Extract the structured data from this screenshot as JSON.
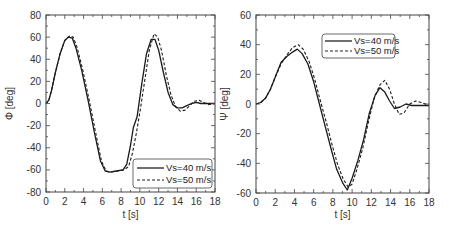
{
  "chart_data": [
    {
      "type": "line",
      "title": "",
      "xlabel": "t [s]",
      "ylabel": "Φ [deg]",
      "xlim": [
        0,
        18
      ],
      "ylim": [
        -80,
        80
      ],
      "xticks": [
        0,
        2,
        4,
        6,
        8,
        10,
        12,
        14,
        16,
        18
      ],
      "yticks": [
        -80,
        -60,
        -40,
        -20,
        0,
        20,
        40,
        60,
        80
      ],
      "grid": false,
      "legend_position": "lower right",
      "series": [
        {
          "name": "Vs=40 m/s",
          "style": "solid",
          "x": [
            0,
            0.3,
            0.6,
            1.0,
            1.5,
            2.0,
            2.4,
            2.8,
            3.2,
            3.8,
            4.5,
            5.2,
            5.8,
            6.3,
            6.8,
            7.5,
            8.2,
            8.6,
            9.0,
            9.3,
            9.7,
            10.2,
            10.7,
            11.2,
            11.6,
            12.0,
            12.5,
            13.0,
            13.5,
            14.0,
            14.5,
            15.0,
            15.5,
            16.0,
            16.5,
            17.0,
            17.5,
            18.0
          ],
          "values": [
            0,
            3,
            12,
            28,
            45,
            57,
            60,
            59,
            50,
            30,
            2,
            -28,
            -52,
            -61,
            -62,
            -61,
            -60,
            -55,
            -38,
            -22,
            -12,
            18,
            45,
            58,
            58,
            48,
            28,
            10,
            -1,
            -4,
            -4,
            -2,
            0,
            1,
            0,
            0,
            0,
            0
          ]
        },
        {
          "name": "Vs=50 m/s",
          "style": "dashed",
          "x": [
            0,
            0.3,
            0.6,
            1.0,
            1.5,
            2.0,
            2.5,
            2.9,
            3.3,
            3.9,
            4.6,
            5.3,
            5.9,
            6.4,
            6.9,
            7.6,
            8.3,
            8.8,
            9.2,
            9.6,
            10.0,
            10.5,
            11.0,
            11.5,
            11.9,
            12.3,
            12.8,
            13.3,
            13.8,
            14.3,
            14.8,
            15.3,
            15.8,
            16.3,
            16.8,
            17.3,
            18.0
          ],
          "values": [
            0,
            3,
            12,
            28,
            45,
            57,
            61,
            60,
            51,
            31,
            3,
            -27,
            -52,
            -61,
            -62,
            -61,
            -60,
            -57,
            -45,
            -28,
            -8,
            20,
            48,
            63,
            60,
            48,
            26,
            8,
            -3,
            -7,
            -6,
            -2,
            2,
            3,
            1,
            -1,
            0
          ]
        }
      ]
    },
    {
      "type": "line",
      "title": "",
      "xlabel": "t [s]",
      "ylabel": "Ψ [deg]",
      "xlim": [
        0,
        18
      ],
      "ylim": [
        -60,
        60
      ],
      "xticks": [
        0,
        2,
        4,
        6,
        8,
        10,
        12,
        14,
        16,
        18
      ],
      "yticks": [
        -60,
        -40,
        -20,
        0,
        20,
        40,
        60
      ],
      "grid": false,
      "legend_position": "upper right",
      "series": [
        {
          "name": "Vs=40 m/s",
          "style": "solid",
          "x": [
            0,
            0.5,
            1.0,
            1.5,
            2.0,
            2.6,
            3.2,
            3.8,
            4.3,
            4.8,
            5.4,
            6.0,
            6.6,
            7.2,
            7.8,
            8.4,
            9.0,
            9.5,
            10.0,
            10.6,
            11.2,
            11.8,
            12.4,
            12.9,
            13.4,
            13.9,
            14.4,
            15.0,
            15.6,
            16.2,
            16.8,
            17.4,
            18.0
          ],
          "values": [
            0,
            1,
            4,
            10,
            18,
            28,
            32,
            35,
            37,
            34,
            27,
            15,
            0,
            -15,
            -30,
            -44,
            -53,
            -58,
            -50,
            -38,
            -24,
            -6,
            6,
            11,
            8,
            2,
            -3,
            -2,
            0,
            -1,
            -1,
            -1,
            -1
          ]
        },
        {
          "name": "Vs=50 m/s",
          "style": "dashed",
          "x": [
            0,
            0.5,
            1.0,
            1.5,
            2.0,
            2.6,
            3.2,
            3.8,
            4.4,
            4.9,
            5.5,
            6.1,
            6.7,
            7.3,
            7.9,
            8.5,
            9.1,
            9.6,
            10.0,
            10.5,
            11.1,
            11.7,
            12.3,
            12.9,
            13.4,
            13.9,
            14.4,
            14.9,
            15.4,
            16.0,
            16.6,
            17.2,
            18.0
          ],
          "values": [
            0,
            1,
            4,
            10,
            18,
            27,
            33,
            38,
            40,
            37,
            29,
            17,
            2,
            -12,
            -27,
            -41,
            -51,
            -56,
            -54,
            -44,
            -30,
            -12,
            4,
            13,
            16,
            10,
            0,
            -7,
            -6,
            0,
            2,
            1,
            -1
          ]
        }
      ]
    }
  ],
  "legend": {
    "left": [
      "Vs=40 m/s",
      "Vs=50 m/s"
    ],
    "right": [
      "Vs=40 m/s",
      "Vs=50 m/s"
    ]
  },
  "axes": {
    "left": {
      "xlabel": "t [s]",
      "ylabel": "Φ [deg]"
    },
    "right": {
      "xlabel": "t [s]",
      "ylabel": "Ψ [deg]"
    }
  }
}
